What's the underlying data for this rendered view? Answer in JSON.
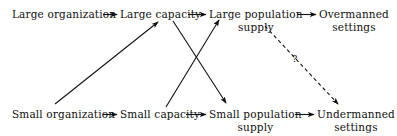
{
  "diagram": {
    "nodes": [
      {
        "id": "large-organization",
        "label": "Large organization",
        "sublabel": ""
      },
      {
        "id": "large-capacity",
        "label": "Large capacity",
        "sublabel": ""
      },
      {
        "id": "large-population",
        "label": "Large population",
        "sublabel": "supply"
      },
      {
        "id": "overmanned-settings",
        "label": "Overmanned",
        "sublabel": "settings"
      },
      {
        "id": "small-organization",
        "label": "Small organization",
        "sublabel": ""
      },
      {
        "id": "small-capacity",
        "label": "Small capacity",
        "sublabel": ""
      },
      {
        "id": "small-population",
        "label": "Small population",
        "sublabel": "supply"
      },
      {
        "id": "undermanned-settings",
        "label": "Undermanned",
        "sublabel": "settings"
      }
    ],
    "edges": [
      {
        "id": "large-org-to-large-cap",
        "from": "large-organization",
        "to": "large-capacity",
        "style": "solid",
        "label": ""
      },
      {
        "id": "large-cap-to-large-pop",
        "from": "large-capacity",
        "to": "large-population",
        "style": "solid",
        "label": ""
      },
      {
        "id": "large-pop-to-overmanned",
        "from": "large-population",
        "to": "overmanned-settings",
        "style": "solid",
        "label": ""
      },
      {
        "id": "small-org-to-small-cap",
        "from": "small-organization",
        "to": "small-capacity",
        "style": "solid",
        "label": ""
      },
      {
        "id": "small-cap-to-small-pop",
        "from": "small-capacity",
        "to": "small-population",
        "style": "solid",
        "label": ""
      },
      {
        "id": "small-pop-to-undermanned",
        "from": "small-population",
        "to": "undermanned-settings",
        "style": "solid",
        "label": ""
      },
      {
        "id": "small-org-to-large-cap",
        "from": "small-organization",
        "to": "large-capacity",
        "style": "solid",
        "label": ""
      },
      {
        "id": "large-cap-to-small-pop",
        "from": "large-capacity",
        "to": "small-population",
        "style": "solid",
        "label": ""
      },
      {
        "id": "small-cap-to-large-pop",
        "from": "small-capacity",
        "to": "large-population",
        "style": "solid",
        "label": ""
      },
      {
        "id": "large-pop-to-undermanned",
        "from": "large-population",
        "to": "undermanned-settings",
        "style": "dashed",
        "label": "?"
      }
    ],
    "annotations": {
      "question_mark": "?"
    },
    "colors": {
      "ink": "#111111",
      "background": "#ffffff"
    }
  }
}
